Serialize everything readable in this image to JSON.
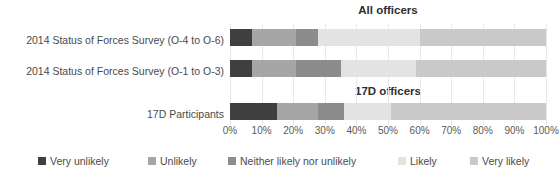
{
  "titles": {
    "top": "All officers",
    "middle": "17D officers"
  },
  "categories": [
    "2014 Status of Forces Survey (O-4 to O-6)",
    "2014 Status of Forces Survey (O-1 to O-3)",
    "17D Participants"
  ],
  "axis": {
    "ticks": [
      "0%",
      "10%",
      "20%",
      "30%",
      "40%",
      "50%",
      "60%",
      "70%",
      "80%",
      "90%",
      "100%"
    ]
  },
  "legend": [
    {
      "label": "Very unlikely",
      "color": "#3f3f3f"
    },
    {
      "label": "Unlikely",
      "color": "#a6a6a6"
    },
    {
      "label": "Neither likely nor unlikely",
      "color": "#8c8c8c"
    },
    {
      "label": "Likely",
      "color": "#e3e3e3"
    },
    {
      "label": "Very likely",
      "color": "#c9c9c9"
    }
  ],
  "chart_data": {
    "type": "bar",
    "orientation": "horizontal",
    "stacked": true,
    "normalized": "percent",
    "xlabel": "",
    "ylabel": "",
    "xlim": [
      0,
      100
    ],
    "grid": true,
    "legend_position": "bottom",
    "categories": [
      "2014 Status of Forces Survey (O-4 to O-6)",
      "2014 Status of Forces Survey (O-1 to O-3)",
      "17D Participants"
    ],
    "series": [
      {
        "name": "Very unlikely",
        "color": "#3f3f3f",
        "values": [
          7,
          7,
          15
        ]
      },
      {
        "name": "Unlikely",
        "color": "#a6a6a6",
        "values": [
          14,
          14,
          13
        ]
      },
      {
        "name": "Neither likely nor unlikely",
        "color": "#8c8c8c",
        "values": [
          7,
          14,
          8
        ]
      },
      {
        "name": "Likely",
        "color": "#e3e3e3",
        "values": [
          32,
          24,
          15
        ]
      },
      {
        "name": "Very likely",
        "color": "#c9c9c9",
        "values": [
          40,
          41,
          49
        ]
      }
    ]
  }
}
